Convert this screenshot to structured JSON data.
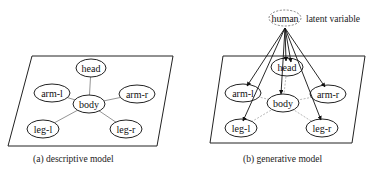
{
  "diagram_a": {
    "caption": "(a) descriptive model",
    "nodes": {
      "head": "head",
      "body": "body",
      "arm_l": "arm-l",
      "arm_r": "arm-r",
      "leg_l": "leg-l",
      "leg_r": "leg-r"
    },
    "edges": [
      [
        "body",
        "head"
      ],
      [
        "body",
        "arm-l"
      ],
      [
        "body",
        "arm-r"
      ],
      [
        "body",
        "leg-l"
      ],
      [
        "body",
        "leg-r"
      ]
    ],
    "edge_style": "solid undirected"
  },
  "diagram_b": {
    "caption": "(b) generative model",
    "latent_node": "human",
    "latent_label": "latent variable",
    "nodes": {
      "head": "head",
      "body": "body",
      "arm_l": "arm-l",
      "arm_r": "arm-r",
      "leg_l": "leg-l",
      "leg_r": "leg-r"
    },
    "edges_directed": [
      [
        "human",
        "head"
      ],
      [
        "human",
        "body"
      ],
      [
        "human",
        "arm-l"
      ],
      [
        "human",
        "arm-r"
      ],
      [
        "human",
        "leg-l"
      ],
      [
        "human",
        "leg-r"
      ]
    ],
    "edges_undirected_dotted": [
      [
        "body",
        "head"
      ],
      [
        "body",
        "arm-l"
      ],
      [
        "body",
        "arm-r"
      ],
      [
        "body",
        "leg-l"
      ],
      [
        "body",
        "leg-r"
      ]
    ]
  },
  "colors": {
    "stroke": "#222222",
    "dotted_edge": "#999999",
    "background": "#ffffff"
  }
}
